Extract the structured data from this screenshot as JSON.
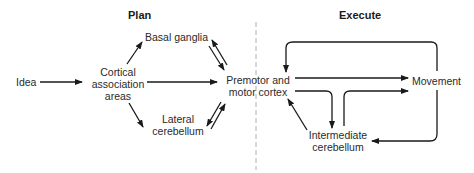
{
  "headers": {
    "plan": "Plan",
    "execute": "Execute"
  },
  "nodes": {
    "idea": "Idea",
    "cortical_line1": "Cortical",
    "cortical_line2": "association",
    "cortical_line3": "areas",
    "basal_ganglia": "Basal ganglia",
    "lateral_line1": "Lateral",
    "lateral_line2": "cerebellum",
    "premotor_line1": "Premotor and",
    "premotor_line2": "motor cortex",
    "movement": "Movement",
    "intermediate_line1": "Intermediate",
    "intermediate_line2": "cerebellum"
  },
  "colors": {
    "stroke": "#1a1a1a",
    "divider": "#b0b0b0",
    "text": "#2a2a2a"
  }
}
